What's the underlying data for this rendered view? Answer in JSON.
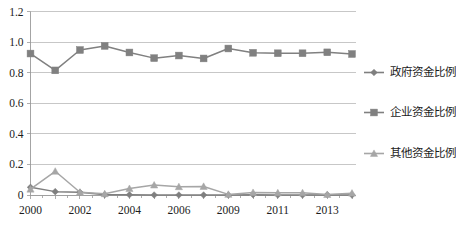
{
  "chart_data": {
    "type": "line",
    "title": "",
    "subtitle": "",
    "xlabel": "",
    "ylabel": "",
    "ylim": [
      0,
      1.2
    ],
    "grid": true,
    "legend_position": "right",
    "x": [
      2000,
      2001,
      2002,
      2003,
      2004,
      2005,
      2006,
      2007,
      2008,
      2009,
      2010,
      2011,
      2012,
      2013
    ],
    "categories": [
      "2000",
      "2001",
      "2002",
      "2003",
      "2004",
      "2005",
      "2006",
      "2007",
      "2008",
      "2009",
      "2010",
      "2011",
      "2012",
      "2013"
    ],
    "xtick_labels": [
      "2000",
      "",
      "2002",
      "",
      "2004",
      "",
      "2006",
      "",
      "2009",
      "",
      "2011",
      "",
      "2013",
      ""
    ],
    "xtick_labels_visible": [
      "2000",
      "2002",
      "2004",
      "2006",
      "2009",
      "2011",
      "2013"
    ],
    "ytick_labels": [
      "0",
      "0.2",
      "0.4",
      "0.6",
      "0.8",
      "1.0",
      "1.2"
    ],
    "ytick_values": [
      0,
      0.2,
      0.4,
      0.6,
      0.8,
      1.0,
      1.2
    ],
    "series": [
      {
        "name": "政府资金比例",
        "marker": "diamond",
        "color": "#7F7F7F",
        "values": [
          0.05,
          0.022,
          0.018,
          0.002,
          0.002,
          0.0,
          0.0,
          0.0,
          0.0,
          0.002,
          0.0,
          0.0,
          0.002,
          0.0
        ]
      },
      {
        "name": "企业资金比例",
        "marker": "square",
        "color": "#808080",
        "values": [
          0.925,
          0.815,
          0.948,
          0.975,
          0.932,
          0.895,
          0.912,
          0.893,
          0.958,
          0.93,
          0.927,
          0.927,
          0.933,
          0.922
        ]
      },
      {
        "name": "其他资金比例",
        "marker": "triangle",
        "color": "#A6A6A6",
        "values": [
          0.038,
          0.155,
          0.018,
          0.008,
          0.042,
          0.065,
          0.054,
          0.056,
          0.004,
          0.016,
          0.014,
          0.014,
          0.003,
          0.012
        ]
      }
    ]
  },
  "legend": {
    "items": [
      {
        "label": "政府资金比例",
        "color": "#7F7F7F",
        "marker": "diamond"
      },
      {
        "label": "企业资金比例",
        "color": "#808080",
        "marker": "square"
      },
      {
        "label": "其他资金比例",
        "color": "#A6A6A6",
        "marker": "triangle"
      }
    ]
  },
  "colors": {
    "gridline": "#b9b9b9",
    "axis": "#9a9a9a",
    "text": "#1c1c1c",
    "background": "#ffffff"
  }
}
